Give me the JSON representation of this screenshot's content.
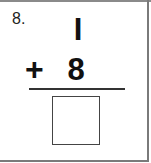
{
  "problem": {
    "number_label": "8.",
    "top_operand": "I",
    "operator": "+",
    "bottom_operand": "8",
    "answer": ""
  }
}
